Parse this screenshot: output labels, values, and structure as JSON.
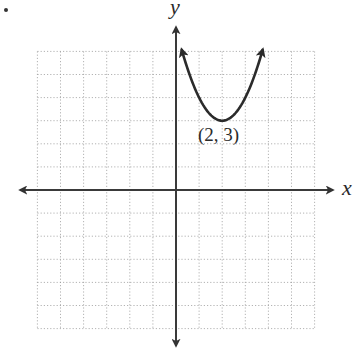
{
  "chart_data": {
    "type": "line",
    "title": "",
    "xlabel": "x",
    "ylabel": "y",
    "xlim": [
      -6,
      6
    ],
    "ylim": [
      -6,
      6
    ],
    "grid": true,
    "grid_style": "dotted",
    "grid_step": 1,
    "axes_arrows": true,
    "series": [
      {
        "name": "parabola",
        "function": "y = (x - 2)^2 + 3",
        "vertex": [
          2,
          3
        ],
        "x": [
          0.24,
          0.5,
          1,
          1.5,
          2,
          2.5,
          3,
          3.5,
          3.76
        ],
        "values": [
          6.1,
          5.25,
          4,
          3.25,
          3,
          3.25,
          4,
          5.25,
          6.1
        ],
        "arrows_both_ends": true,
        "color": "#2b2b2b"
      }
    ],
    "annotations": [
      {
        "text": "(2, 3)",
        "x": 2,
        "y": 3,
        "position": "below"
      }
    ]
  },
  "labels": {
    "x_axis": "x",
    "y_axis": "y",
    "vertex_label": "(2, 3)"
  },
  "colors": {
    "axis": "#3a3a3a",
    "grid": "#9a9a9a",
    "curve": "#2b2b2b"
  }
}
